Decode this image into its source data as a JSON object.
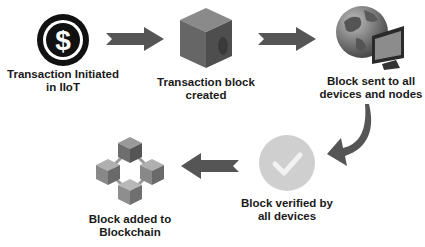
{
  "diagram": {
    "type": "process-flow",
    "steps": [
      {
        "id": "step1",
        "icon": "dollar-coin-icon",
        "label_line1": "Transaction Initiated",
        "label_line2": "in IIoT"
      },
      {
        "id": "step2",
        "icon": "cube-block-icon",
        "label_line1": "Transaction block",
        "label_line2": "created"
      },
      {
        "id": "step3",
        "icon": "globe-monitor-icon",
        "label_line1": "Block sent to all",
        "label_line2": "devices and nodes"
      },
      {
        "id": "step4",
        "icon": "check-circle-icon",
        "label_line1": "Block verified by",
        "label_line2": "all devices"
      },
      {
        "id": "step5",
        "icon": "blockchain-icon",
        "label_line1": "Block added to",
        "label_line2": "Blockchain"
      }
    ],
    "colors": {
      "arrow": "#555555",
      "text": "#1a1a1a",
      "check_circle": "#cfcfcf",
      "cube": "#6b6b6b"
    }
  }
}
